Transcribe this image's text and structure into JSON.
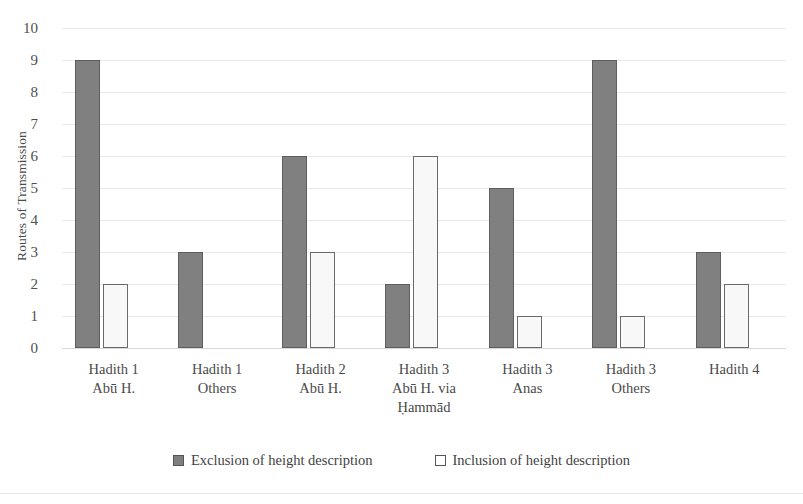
{
  "chart_data": {
    "type": "bar",
    "title": "",
    "xlabel": "",
    "ylabel": "Routes of Transmission",
    "ylim": [
      0,
      10
    ],
    "ytick_labels": [
      "10",
      "9",
      "8",
      "7",
      "6",
      "5",
      "4",
      "3",
      "2",
      "1",
      "0"
    ],
    "grid": true,
    "legend_position": "bottom-center",
    "categories": [
      "Hadith 1 Abū H.",
      "Hadith 1 Others",
      "Hadith 2 Abū H.",
      "Hadith 3 Abū H. via Ḥammād",
      "Hadith 3 Anas",
      "Hadith 3 Others",
      "Hadith 4"
    ],
    "category_lines": [
      [
        "Hadith 1",
        "Abū H."
      ],
      [
        "Hadith 1",
        "Others"
      ],
      [
        "Hadith 2",
        "Abū H."
      ],
      [
        "Hadith 3",
        "Abū H. via",
        "Ḥammād"
      ],
      [
        "Hadith 3",
        "Anas"
      ],
      [
        "Hadith 3",
        "Others"
      ],
      [
        "Hadith 4"
      ]
    ],
    "series": [
      {
        "name": "Exclusion of height description",
        "color": "#808080",
        "values": [
          9,
          3,
          6,
          2,
          5,
          9,
          3
        ]
      },
      {
        "name": "Inclusion of height description",
        "color": "#f8f8f8",
        "values": [
          2,
          0,
          3,
          6,
          1,
          1,
          2
        ]
      }
    ]
  },
  "legend": {
    "items": [
      {
        "label": "Exclusion of height description",
        "swatch": "filled-gray-square-icon"
      },
      {
        "label": "Inclusion of height description",
        "swatch": "outlined-white-square-icon"
      }
    ]
  }
}
